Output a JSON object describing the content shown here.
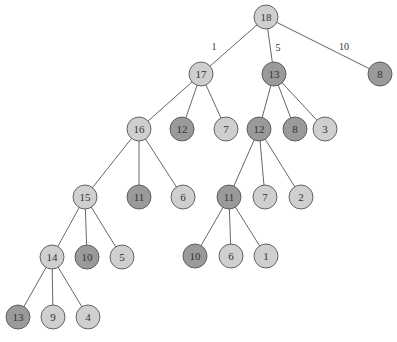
{
  "colors": {
    "light": "#cfcfcf",
    "dark": "#9a9a9a",
    "edge": "#555555"
  },
  "nodes": [
    {
      "id": "n18",
      "label": "18",
      "shade": "light"
    },
    {
      "id": "n17",
      "label": "17",
      "shade": "light"
    },
    {
      "id": "n13a",
      "label": "13",
      "shade": "dark"
    },
    {
      "id": "n8a",
      "label": "8",
      "shade": "dark"
    },
    {
      "id": "n16",
      "label": "16",
      "shade": "light"
    },
    {
      "id": "n12a",
      "label": "12",
      "shade": "dark"
    },
    {
      "id": "n7a",
      "label": "7",
      "shade": "light"
    },
    {
      "id": "n12b",
      "label": "12",
      "shade": "dark"
    },
    {
      "id": "n8b",
      "label": "8",
      "shade": "dark"
    },
    {
      "id": "n3",
      "label": "3",
      "shade": "light"
    },
    {
      "id": "n15",
      "label": "15",
      "shade": "light"
    },
    {
      "id": "n11a",
      "label": "11",
      "shade": "dark"
    },
    {
      "id": "n6a",
      "label": "6",
      "shade": "light"
    },
    {
      "id": "n11b",
      "label": "11",
      "shade": "dark"
    },
    {
      "id": "n7b",
      "label": "7",
      "shade": "light"
    },
    {
      "id": "n2",
      "label": "2",
      "shade": "light"
    },
    {
      "id": "n14",
      "label": "14",
      "shade": "light"
    },
    {
      "id": "n10a",
      "label": "10",
      "shade": "dark"
    },
    {
      "id": "n5",
      "label": "5",
      "shade": "light"
    },
    {
      "id": "n10b",
      "label": "10",
      "shade": "dark"
    },
    {
      "id": "n6b",
      "label": "6",
      "shade": "light"
    },
    {
      "id": "n1",
      "label": "1",
      "shade": "light"
    },
    {
      "id": "n13b",
      "label": "13",
      "shade": "dark"
    },
    {
      "id": "n9",
      "label": "9",
      "shade": "light"
    },
    {
      "id": "n4",
      "label": "4",
      "shade": "light"
    }
  ],
  "edges": [
    {
      "from": "n18",
      "to": "n17",
      "label": "1"
    },
    {
      "from": "n18",
      "to": "n13a",
      "label": "5"
    },
    {
      "from": "n18",
      "to": "n8a",
      "label": "10"
    },
    {
      "from": "n17",
      "to": "n16",
      "label": ""
    },
    {
      "from": "n17",
      "to": "n12a",
      "label": ""
    },
    {
      "from": "n17",
      "to": "n7a",
      "label": ""
    },
    {
      "from": "n13a",
      "to": "n12b",
      "label": ""
    },
    {
      "from": "n13a",
      "to": "n8b",
      "label": ""
    },
    {
      "from": "n13a",
      "to": "n3",
      "label": ""
    },
    {
      "from": "n16",
      "to": "n15",
      "label": ""
    },
    {
      "from": "n16",
      "to": "n11a",
      "label": ""
    },
    {
      "from": "n16",
      "to": "n6a",
      "label": ""
    },
    {
      "from": "n12b",
      "to": "n11b",
      "label": ""
    },
    {
      "from": "n12b",
      "to": "n7b",
      "label": ""
    },
    {
      "from": "n12b",
      "to": "n2",
      "label": ""
    },
    {
      "from": "n15",
      "to": "n14",
      "label": ""
    },
    {
      "from": "n15",
      "to": "n10a",
      "label": ""
    },
    {
      "from": "n15",
      "to": "n5",
      "label": ""
    },
    {
      "from": "n11b",
      "to": "n10b",
      "label": ""
    },
    {
      "from": "n11b",
      "to": "n6b",
      "label": ""
    },
    {
      "from": "n11b",
      "to": "n1",
      "label": ""
    },
    {
      "from": "n14",
      "to": "n13b",
      "label": ""
    },
    {
      "from": "n14",
      "to": "n9",
      "label": ""
    },
    {
      "from": "n14",
      "to": "n4",
      "label": ""
    }
  ]
}
